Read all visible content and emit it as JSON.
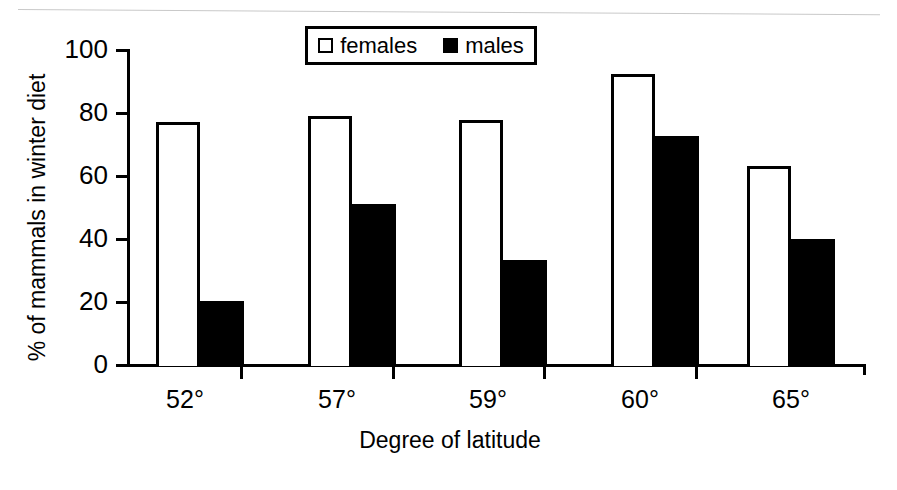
{
  "chart_data": {
    "type": "bar",
    "title": "",
    "categories": [
      "52°",
      "57°",
      "59°",
      "60°",
      "65°"
    ],
    "series": [
      {
        "name": "females",
        "values": [
          77,
          79,
          77.5,
          92,
          63
        ],
        "style": "open-white"
      },
      {
        "name": "males",
        "values": [
          20.5,
          51,
          33.5,
          72.5,
          40
        ],
        "style": "solid-black"
      }
    ],
    "xlabel": "Degree of latitude",
    "ylabel": "% of mammals in winter diet",
    "ylim": [
      0,
      100
    ],
    "yticks": [
      0,
      20,
      40,
      60,
      80,
      100
    ],
    "ytick_labels": [
      "0",
      "20",
      "40",
      "60",
      "80",
      "100"
    ],
    "grid": false,
    "legend_position": "top-center",
    "colors": {
      "females": "#ffffff",
      "males": "#000000",
      "axis": "#000000",
      "background": "#ffffff"
    }
  },
  "legend": {
    "items": [
      {
        "label": "females",
        "swatch": "open-square-icon"
      },
      {
        "label": "males",
        "swatch": "filled-square-icon"
      }
    ]
  }
}
